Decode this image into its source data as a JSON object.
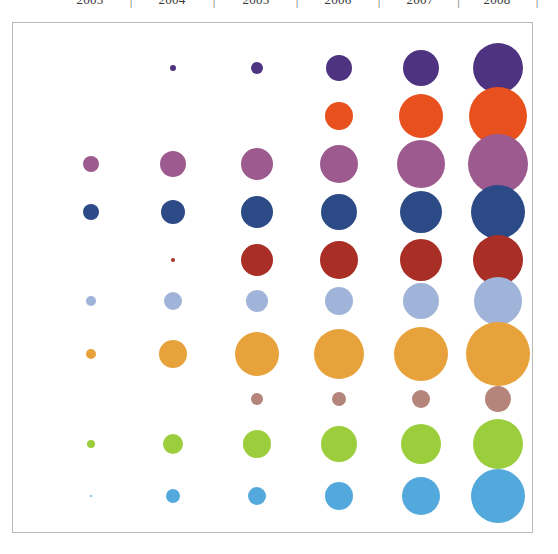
{
  "chart_data": {
    "type": "scatter",
    "title": "",
    "subtitle": "",
    "xlabel": "",
    "ylabel": "",
    "grid": false,
    "legend": "none",
    "categories": [
      "2003",
      "2004",
      "2005",
      "2006",
      "2007",
      "2008"
    ],
    "column_separator": "|",
    "x_positions": [
      90,
      172,
      256,
      338,
      420,
      497
    ],
    "y_positions": [
      67,
      115,
      163,
      211,
      259,
      300,
      353,
      398,
      443,
      495
    ],
    "series": [
      {
        "name": "Series 1",
        "color": "#4E3480",
        "y": 67,
        "radii": [
          0,
          3,
          6,
          13,
          18,
          25
        ],
        "values": [
          0,
          1,
          4,
          17,
          32,
          62
        ]
      },
      {
        "name": "Series 2",
        "color": "#E8501D",
        "y": 115,
        "radii": [
          0,
          0,
          0,
          14,
          22,
          29
        ],
        "values": [
          0,
          0,
          0,
          20,
          48,
          84
        ]
      },
      {
        "name": "Series 3",
        "color": "#9C5A8F",
        "y": 163,
        "radii": [
          8,
          13,
          16,
          19,
          24,
          30
        ],
        "values": [
          6,
          17,
          26,
          36,
          58,
          90
        ]
      },
      {
        "name": "Series 4",
        "color": "#2C4B86",
        "y": 211,
        "radii": [
          8,
          12,
          16,
          18,
          21,
          27
        ],
        "values": [
          6,
          14,
          26,
          32,
          44,
          73
        ]
      },
      {
        "name": "Series 5",
        "color": "#A82E26",
        "y": 259,
        "radii": [
          0,
          2,
          16,
          19,
          21,
          25
        ],
        "values": [
          0,
          1,
          26,
          36,
          44,
          62
        ]
      },
      {
        "name": "Series 6",
        "color": "#9FB4D8",
        "y": 300,
        "radii": [
          5,
          9,
          11,
          14,
          18,
          24
        ],
        "values": [
          3,
          8,
          12,
          20,
          32,
          58
        ]
      },
      {
        "name": "Series 7",
        "color": "#E8A23C",
        "y": 353,
        "radii": [
          5,
          14,
          22,
          25,
          27,
          32
        ],
        "values": [
          3,
          20,
          48,
          62,
          73,
          102
        ]
      },
      {
        "name": "Series 8",
        "color": "#B5857B",
        "y": 398,
        "radii": [
          0,
          0,
          6,
          7,
          9,
          13
        ],
        "values": [
          0,
          0,
          4,
          5,
          8,
          17
        ]
      },
      {
        "name": "Series 9",
        "color": "#9BCD3D",
        "y": 443,
        "radii": [
          4,
          10,
          14,
          18,
          20,
          25
        ],
        "values": [
          2,
          10,
          20,
          32,
          40,
          62
        ]
      },
      {
        "name": "Series 10",
        "color": "#54A9DC",
        "y": 495,
        "radii": [
          1,
          7,
          9,
          14,
          19,
          27
        ],
        "values": [
          0.3,
          5,
          8,
          20,
          36,
          73
        ]
      }
    ]
  }
}
